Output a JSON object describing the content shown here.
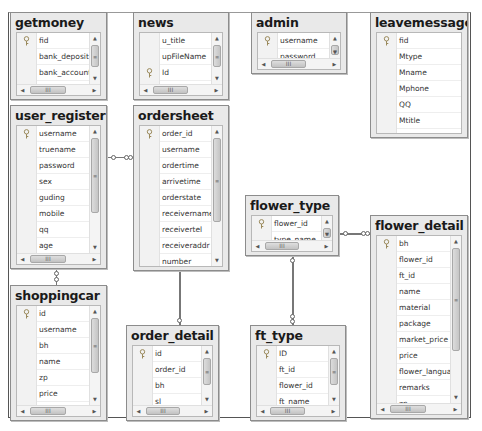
{
  "diagram": {
    "type": "database-relationship-diagram",
    "tables": [
      {
        "id": "getmoney",
        "title": "getmoney",
        "columns": [
          {
            "name": "fid",
            "primary_key": true
          },
          {
            "name": "bank_deposit",
            "primary_key": false
          },
          {
            "name": "bank_account",
            "primary_key": false
          },
          {
            "name": "payee",
            "primary_key": false
          }
        ],
        "has_vscroll": true,
        "has_hscroll": true
      },
      {
        "id": "news",
        "title": "news",
        "columns": [
          {
            "name": "u_title",
            "primary_key": false
          },
          {
            "name": "upFileName",
            "primary_key": false
          },
          {
            "name": "Id",
            "primary_key": true
          },
          {
            "name": "u_time",
            "primary_key": false
          }
        ],
        "has_vscroll": true,
        "has_hscroll": true
      },
      {
        "id": "admin",
        "title": "admin",
        "columns": [
          {
            "name": "username",
            "primary_key": true
          },
          {
            "name": "password",
            "primary_key": false
          }
        ],
        "has_vscroll": true,
        "has_hscroll": true
      },
      {
        "id": "leavemessage",
        "title": "leavemessage",
        "columns": [
          {
            "name": "fid",
            "primary_key": true
          },
          {
            "name": "Mtype",
            "primary_key": false
          },
          {
            "name": "Mname",
            "primary_key": false
          },
          {
            "name": "Mphone",
            "primary_key": false
          },
          {
            "name": "QQ",
            "primary_key": false
          },
          {
            "name": "Mtitle",
            "primary_key": false
          },
          {
            "name": "Mtext",
            "primary_key": false
          }
        ],
        "has_vscroll": false,
        "has_hscroll": false
      },
      {
        "id": "user_register",
        "title": "user_register",
        "columns": [
          {
            "name": "username",
            "primary_key": true
          },
          {
            "name": "truename",
            "primary_key": false
          },
          {
            "name": "password",
            "primary_key": false
          },
          {
            "name": "sex",
            "primary_key": false
          },
          {
            "name": "guding",
            "primary_key": false
          },
          {
            "name": "mobile",
            "primary_key": false
          },
          {
            "name": "qq",
            "primary_key": false
          },
          {
            "name": "age",
            "primary_key": false
          },
          {
            "name": "birthday",
            "primary_key": false
          }
        ],
        "has_vscroll": true,
        "has_hscroll": true
      },
      {
        "id": "ordersheet",
        "title": "ordersheet",
        "columns": [
          {
            "name": "order_id",
            "primary_key": true
          },
          {
            "name": "username",
            "primary_key": false
          },
          {
            "name": "ordertime",
            "primary_key": false
          },
          {
            "name": "arrivetime",
            "primary_key": false
          },
          {
            "name": "orderstate",
            "primary_key": false
          },
          {
            "name": "receivername",
            "primary_key": false
          },
          {
            "name": "receivertel",
            "primary_key": false
          },
          {
            "name": "receiveraddr",
            "primary_key": false
          },
          {
            "name": "number",
            "primary_key": false
          },
          {
            "name": "paymoney",
            "primary_key": false
          }
        ],
        "has_vscroll": true,
        "has_hscroll": false
      },
      {
        "id": "flower_type",
        "title": "flower_type",
        "columns": [
          {
            "name": "flower_id",
            "primary_key": true
          },
          {
            "name": "type_name",
            "primary_key": false
          }
        ],
        "has_vscroll": true,
        "has_hscroll": true
      },
      {
        "id": "flower_detail",
        "title": "flower_detail",
        "columns": [
          {
            "name": "bh",
            "primary_key": true
          },
          {
            "name": "flower_id",
            "primary_key": false
          },
          {
            "name": "ft_id",
            "primary_key": false
          },
          {
            "name": "name",
            "primary_key": false
          },
          {
            "name": "material",
            "primary_key": false
          },
          {
            "name": "package",
            "primary_key": false
          },
          {
            "name": "market_price",
            "primary_key": false
          },
          {
            "name": "price",
            "primary_key": false
          },
          {
            "name": "flower_language",
            "primary_key": false
          },
          {
            "name": "remarks",
            "primary_key": false
          },
          {
            "name": "zp",
            "primary_key": false
          },
          {
            "name": "count",
            "primary_key": false
          }
        ],
        "has_vscroll": true,
        "has_hscroll": true
      },
      {
        "id": "shoppingcar",
        "title": "shoppingcar",
        "columns": [
          {
            "name": "id",
            "primary_key": true
          },
          {
            "name": "username",
            "primary_key": false
          },
          {
            "name": "bh",
            "primary_key": false
          },
          {
            "name": "name",
            "primary_key": false
          },
          {
            "name": "zp",
            "primary_key": false
          },
          {
            "name": "price",
            "primary_key": false
          },
          {
            "name": "sl",
            "primary_key": false
          }
        ],
        "has_vscroll": true,
        "has_hscroll": true
      },
      {
        "id": "order_detail",
        "title": "order_detail",
        "columns": [
          {
            "name": "id",
            "primary_key": true
          },
          {
            "name": "order_id",
            "primary_key": false
          },
          {
            "name": "bh",
            "primary_key": false
          },
          {
            "name": "sl",
            "primary_key": false
          }
        ],
        "has_vscroll": true,
        "has_hscroll": true
      },
      {
        "id": "ft_type",
        "title": "ft_type",
        "columns": [
          {
            "name": "ID",
            "primary_key": true
          },
          {
            "name": "ft_id",
            "primary_key": false
          },
          {
            "name": "flower_id",
            "primary_key": false
          },
          {
            "name": "ft_name",
            "primary_key": false
          }
        ],
        "has_vscroll": true,
        "has_hscroll": true
      }
    ],
    "relationships": [
      {
        "from": "user_register",
        "to": "ordersheet",
        "orientation": "horizontal"
      },
      {
        "from": "user_register",
        "to": "shoppingcar",
        "orientation": "vertical"
      },
      {
        "from": "ordersheet",
        "to": "order_detail",
        "orientation": "vertical"
      },
      {
        "from": "flower_type",
        "to": "flower_detail",
        "orientation": "horizontal"
      },
      {
        "from": "flower_type",
        "to": "ft_type",
        "orientation": "vertical"
      }
    ],
    "scroll_glyphs": {
      "up": "▲",
      "down": "▼",
      "left": "◀",
      "right": "▶",
      "vthumb_grip": "≡",
      "hthumb_grip": "III"
    },
    "icons": {
      "primary_key": "key-icon"
    }
  }
}
